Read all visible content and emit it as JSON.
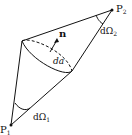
{
  "diagram": {
    "points": {
      "p1": {
        "label": "P",
        "sub": "1"
      },
      "p2": {
        "label": "P",
        "sub": "2"
      }
    },
    "normal_label": "n",
    "area_label": "da",
    "solid_angle_1": {
      "label": "dΩ",
      "sub": "1"
    },
    "solid_angle_2": {
      "label": "dΩ",
      "sub": "2"
    }
  }
}
